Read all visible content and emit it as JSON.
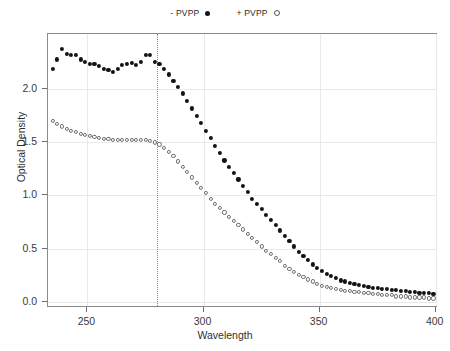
{
  "chart_data": {
    "type": "scatter",
    "title": "",
    "xlabel": "Wavelength",
    "ylabel": "Optical Density",
    "xlim": [
      233,
      401
    ],
    "ylim": [
      -0.06,
      2.52
    ],
    "xticks": [
      250,
      300,
      350,
      400
    ],
    "xticklabels": [
      "250",
      "300",
      "350",
      "400"
    ],
    "yticks": [
      0.0,
      0.5,
      1.0,
      1.5,
      2.0
    ],
    "yticklabels": [
      "0.0",
      "0.5",
      "1.0",
      "1.5",
      "2.0"
    ],
    "grid": true,
    "legend_position": "top-center",
    "annotations": [
      {
        "type": "vline",
        "x": 280,
        "style": "dotted",
        "color": "#8d8d8d"
      }
    ],
    "series": [
      {
        "name": "- PVPP",
        "marker": "filled-circle",
        "color": "#131313",
        "x": [
          235,
          237,
          239,
          241,
          243,
          245,
          247,
          249,
          251,
          253,
          255,
          257,
          259,
          261,
          263,
          265,
          267,
          269,
          271,
          273,
          275,
          277,
          279,
          281,
          283,
          285,
          287,
          289,
          291,
          293,
          295,
          297,
          299,
          301,
          303,
          305,
          307,
          309,
          311,
          313,
          315,
          317,
          319,
          321,
          323,
          325,
          327,
          329,
          331,
          333,
          335,
          337,
          339,
          341,
          343,
          345,
          347,
          349,
          351,
          353,
          355,
          357,
          359,
          361,
          363,
          365,
          367,
          369,
          371,
          373,
          375,
          377,
          379,
          381,
          383,
          385,
          387,
          389,
          391,
          393,
          395,
          397,
          399
        ],
        "y": [
          2.19,
          2.28,
          2.38,
          2.33,
          2.32,
          2.32,
          2.28,
          2.26,
          2.24,
          2.24,
          2.22,
          2.19,
          2.18,
          2.16,
          2.19,
          2.23,
          2.24,
          2.25,
          2.23,
          2.26,
          2.32,
          2.32,
          2.26,
          2.24,
          2.19,
          2.14,
          2.08,
          2.02,
          1.96,
          1.89,
          1.82,
          1.75,
          1.68,
          1.61,
          1.54,
          1.47,
          1.4,
          1.33,
          1.27,
          1.21,
          1.15,
          1.09,
          1.03,
          0.97,
          0.92,
          0.87,
          0.82,
          0.77,
          0.72,
          0.67,
          0.62,
          0.57,
          0.52,
          0.47,
          0.43,
          0.39,
          0.35,
          0.32,
          0.29,
          0.26,
          0.24,
          0.22,
          0.2,
          0.19,
          0.18,
          0.17,
          0.16,
          0.15,
          0.14,
          0.13,
          0.13,
          0.12,
          0.12,
          0.11,
          0.11,
          0.1,
          0.1,
          0.09,
          0.09,
          0.08,
          0.08,
          0.08,
          0.07
        ]
      },
      {
        "name": "+ PVPP",
        "marker": "open-circle",
        "color": "#6e6e6e",
        "x": [
          235,
          237,
          239,
          241,
          243,
          245,
          247,
          249,
          251,
          253,
          255,
          257,
          259,
          261,
          263,
          265,
          267,
          269,
          271,
          273,
          275,
          277,
          279,
          281,
          283,
          285,
          287,
          289,
          291,
          293,
          295,
          297,
          299,
          301,
          303,
          305,
          307,
          309,
          311,
          313,
          315,
          317,
          319,
          321,
          323,
          325,
          327,
          329,
          331,
          333,
          335,
          337,
          339,
          341,
          343,
          345,
          347,
          349,
          351,
          353,
          355,
          357,
          359,
          361,
          363,
          365,
          367,
          369,
          371,
          373,
          375,
          377,
          379,
          381,
          383,
          385,
          387,
          389,
          391,
          393,
          395,
          397,
          399
        ],
        "y": [
          1.7,
          1.67,
          1.65,
          1.63,
          1.61,
          1.6,
          1.58,
          1.57,
          1.56,
          1.55,
          1.54,
          1.53,
          1.53,
          1.52,
          1.52,
          1.52,
          1.52,
          1.52,
          1.52,
          1.52,
          1.52,
          1.51,
          1.5,
          1.48,
          1.45,
          1.41,
          1.37,
          1.32,
          1.27,
          1.22,
          1.17,
          1.12,
          1.07,
          1.02,
          0.97,
          0.92,
          0.88,
          0.84,
          0.8,
          0.76,
          0.72,
          0.68,
          0.64,
          0.6,
          0.56,
          0.52,
          0.48,
          0.45,
          0.41,
          0.38,
          0.34,
          0.31,
          0.28,
          0.25,
          0.23,
          0.21,
          0.19,
          0.17,
          0.15,
          0.14,
          0.13,
          0.12,
          0.11,
          0.1,
          0.1,
          0.09,
          0.09,
          0.08,
          0.08,
          0.07,
          0.07,
          0.06,
          0.06,
          0.06,
          0.05,
          0.05,
          0.05,
          0.04,
          0.04,
          0.04,
          0.04,
          0.03,
          0.03
        ]
      }
    ]
  },
  "legend": {
    "entries": [
      {
        "label": "- PVPP",
        "marker": "filled-circle"
      },
      {
        "label": "+ PVPP",
        "marker": "open-circle"
      }
    ]
  }
}
